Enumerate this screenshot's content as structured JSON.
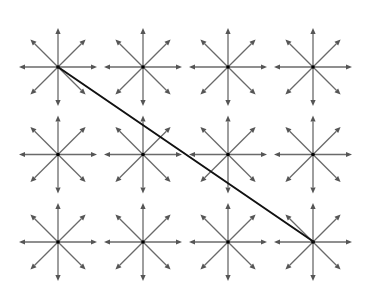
{
  "diagram": {
    "title": "",
    "grid": {
      "rows": 3,
      "cols": 4
    },
    "directions": [
      "N",
      "NE",
      "E",
      "SE",
      "S",
      "SW",
      "W",
      "NW"
    ],
    "arrows_per_node": 8,
    "segment": {
      "from": {
        "row": 0,
        "col": 0
      },
      "to": {
        "row": 2,
        "col": 3
      }
    },
    "colors": {
      "arrow": "#6a6a6a",
      "arrowhead": "#555555",
      "node": "#000000",
      "segment": "#111111",
      "background": "#ffffff"
    }
  }
}
